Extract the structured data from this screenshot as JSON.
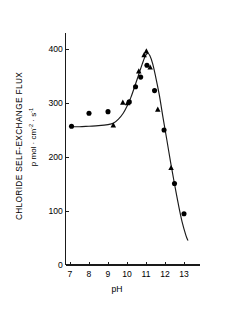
{
  "chart_data": {
    "type": "scatter",
    "title": "",
    "xlabel": "pH",
    "ylabel": "CHLORIDE SELF-EXCHANGE FLUX",
    "ylabel_units": "p mol · cm-2 · s-1",
    "ylabel_units_parts": {
      "prefix": "p mol · cm",
      "exp1": "-2",
      "middle": " · s",
      "exp2": "-1"
    },
    "xlim": [
      7,
      13.8
    ],
    "ylim": [
      0,
      430
    ],
    "xticks": [
      7,
      8,
      9,
      10,
      11,
      12,
      13
    ],
    "xtick_labels": [
      "7",
      "8",
      "9",
      "10",
      "11",
      "12",
      "13"
    ],
    "yticks": [
      0,
      100,
      200,
      300,
      400
    ],
    "ytick_labels": [
      "0",
      "100",
      "200",
      "300",
      "400"
    ],
    "grid": false,
    "legend": false,
    "series": [
      {
        "name": "circles",
        "marker": "circle",
        "points": [
          {
            "x": 7.08,
            "y": 257
          },
          {
            "x": 8.0,
            "y": 281
          },
          {
            "x": 9.0,
            "y": 284
          },
          {
            "x": 10.12,
            "y": 302
          },
          {
            "x": 10.45,
            "y": 330
          },
          {
            "x": 10.72,
            "y": 348
          },
          {
            "x": 11.05,
            "y": 370
          },
          {
            "x": 11.45,
            "y": 323
          },
          {
            "x": 11.95,
            "y": 250
          },
          {
            "x": 12.5,
            "y": 151
          },
          {
            "x": 13.0,
            "y": 95
          }
        ]
      },
      {
        "name": "triangles",
        "marker": "triangle",
        "points": [
          {
            "x": 9.28,
            "y": 259
          },
          {
            "x": 9.78,
            "y": 301
          },
          {
            "x": 10.03,
            "y": 300
          },
          {
            "x": 10.62,
            "y": 359
          },
          {
            "x": 10.9,
            "y": 389
          },
          {
            "x": 11.02,
            "y": 396
          },
          {
            "x": 11.22,
            "y": 366
          },
          {
            "x": 11.62,
            "y": 288
          },
          {
            "x": 12.32,
            "y": 180
          }
        ]
      }
    ],
    "fit_curve": [
      {
        "x": 7.08,
        "y": 256
      },
      {
        "x": 7.5,
        "y": 256
      },
      {
        "x": 8.0,
        "y": 257
      },
      {
        "x": 8.5,
        "y": 258
      },
      {
        "x": 9.0,
        "y": 260
      },
      {
        "x": 9.3,
        "y": 263
      },
      {
        "x": 9.55,
        "y": 270
      },
      {
        "x": 9.8,
        "y": 281
      },
      {
        "x": 10.0,
        "y": 294
      },
      {
        "x": 10.2,
        "y": 310
      },
      {
        "x": 10.4,
        "y": 330
      },
      {
        "x": 10.6,
        "y": 351
      },
      {
        "x": 10.8,
        "y": 372
      },
      {
        "x": 10.95,
        "y": 386
      },
      {
        "x": 11.08,
        "y": 392
      },
      {
        "x": 11.2,
        "y": 388
      },
      {
        "x": 11.35,
        "y": 373
      },
      {
        "x": 11.5,
        "y": 350
      },
      {
        "x": 11.7,
        "y": 315
      },
      {
        "x": 11.9,
        "y": 272
      },
      {
        "x": 12.1,
        "y": 231
      },
      {
        "x": 12.3,
        "y": 189
      },
      {
        "x": 12.5,
        "y": 150
      },
      {
        "x": 12.7,
        "y": 113
      },
      {
        "x": 12.9,
        "y": 80
      },
      {
        "x": 13.1,
        "y": 55
      },
      {
        "x": 13.2,
        "y": 46
      }
    ],
    "colors": {
      "axis": "#1a1a1a",
      "curve": "#1a1a1a",
      "marker": "#000000",
      "background": "#ffffff"
    }
  }
}
